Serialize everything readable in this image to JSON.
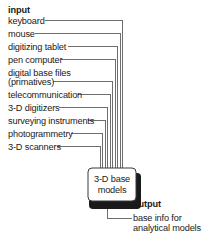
{
  "diagram": {
    "type": "flow-diagram",
    "title_implicit": "3-D base models input/output diagram",
    "background_color": "#ffffff",
    "line_color": "#6e6e6e",
    "text_color": "#1a1a1a",
    "shadow_color": "#1a1a1a"
  },
  "input": {
    "heading": "input",
    "items": [
      {
        "label": "keyboard",
        "lines": [
          "keyboard"
        ]
      },
      {
        "label": "mouse",
        "lines": [
          "mouse"
        ]
      },
      {
        "label": "digitizing tablet",
        "lines": [
          "digitizing tablet"
        ]
      },
      {
        "label": "pen computer",
        "lines": [
          "pen computer"
        ]
      },
      {
        "label": "digital base files (primatives)",
        "lines": [
          "digital base files",
          "(primatives)"
        ]
      },
      {
        "label": "telecommunication",
        "lines": [
          "telecommunication"
        ]
      },
      {
        "label": "3-D digitizers",
        "lines": [
          "3-D digitizers"
        ]
      },
      {
        "label": "surveying instruments",
        "lines": [
          "surveying instruments"
        ]
      },
      {
        "label": "photogrammetry",
        "lines": [
          "photogrammetry"
        ]
      },
      {
        "label": "3-D scanners",
        "lines": [
          "3-D scanners"
        ]
      }
    ]
  },
  "process": {
    "box_label_line1": "3-D base",
    "box_label_line2": "models",
    "box_label": "3-D base models"
  },
  "output": {
    "heading": "output",
    "line1": "base info for",
    "line2": "analytical models",
    "label": "base info for analytical models"
  }
}
